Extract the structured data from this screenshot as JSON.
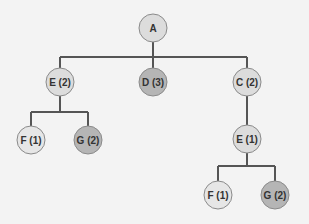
{
  "colors": {
    "background": "#f3f3f3",
    "edge": "#555555",
    "node_stroke": "#8a8a8a",
    "light": "#dcdcdc",
    "lighter": "#e6e6e6",
    "dark": "#b5b5b5"
  },
  "tree": {
    "nodes": [
      {
        "id": "A",
        "label": "A",
        "cx": 153,
        "cy": 28,
        "fill": "light"
      },
      {
        "id": "E2",
        "label": "E (2)",
        "cx": 60,
        "cy": 82,
        "fill": "light"
      },
      {
        "id": "D3",
        "label": "D (3)",
        "cx": 153,
        "cy": 82,
        "fill": "dark"
      },
      {
        "id": "C2",
        "label": "C (2)",
        "cx": 247,
        "cy": 82,
        "fill": "light"
      },
      {
        "id": "F1a",
        "label": "F (1)",
        "cx": 31,
        "cy": 140,
        "fill": "lighter"
      },
      {
        "id": "G2a",
        "label": "G (2)",
        "cx": 88,
        "cy": 140,
        "fill": "dark"
      },
      {
        "id": "E1",
        "label": "E (1)",
        "cx": 247,
        "cy": 139,
        "fill": "light"
      },
      {
        "id": "F1b",
        "label": "F (1)",
        "cx": 218,
        "cy": 195,
        "fill": "lighter"
      },
      {
        "id": "G2b",
        "label": "G (2)",
        "cx": 275,
        "cy": 195,
        "fill": "dark"
      }
    ],
    "edges": [
      {
        "from": "A",
        "to": [
          "E2",
          "D3",
          "C2"
        ],
        "bar_y": 57
      },
      {
        "from": "E2",
        "to": [
          "F1a",
          "G2a"
        ],
        "bar_y": 112
      },
      {
        "from": "C2",
        "to": [
          "E1"
        ],
        "bar_y": 110
      },
      {
        "from": "E1",
        "to": [
          "F1b",
          "G2b"
        ],
        "bar_y": 166
      }
    ],
    "radius": 14
  }
}
